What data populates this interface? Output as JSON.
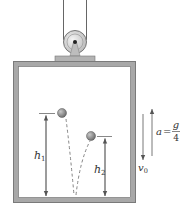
{
  "figure": {
    "type": "physics-diagram"
  },
  "labels": {
    "h1_base": "h",
    "h1_sub": "1",
    "h2_base": "h",
    "h2_sub": "2",
    "v0_base": "v",
    "v0_sub": "0",
    "accel_lhs": "a",
    "accel_eq": "=",
    "accel_num": "g",
    "accel_den": "4"
  },
  "colors": {
    "wall": "#a3a3a3",
    "wall_edge": "#6e6e6e",
    "ball": "#8a8a8a",
    "line": "#555555",
    "text": "#333333"
  }
}
